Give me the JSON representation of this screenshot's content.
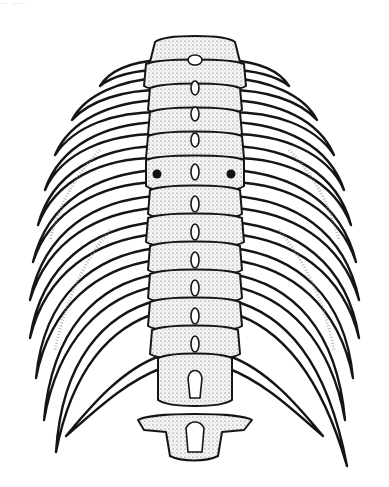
{
  "header": {
    "text": "— ——"
  },
  "figure": {
    "style": "stipple-ink-illustration",
    "rib_pairs": 12,
    "vertebrae": 13,
    "markers": [
      {
        "side": "left",
        "x": 157,
        "y": 174
      },
      {
        "side": "right",
        "x": 231,
        "y": 174
      }
    ],
    "colors": {
      "ink": "#151515",
      "paper": "#ffffff",
      "stipple": "#8a8a8a"
    }
  }
}
